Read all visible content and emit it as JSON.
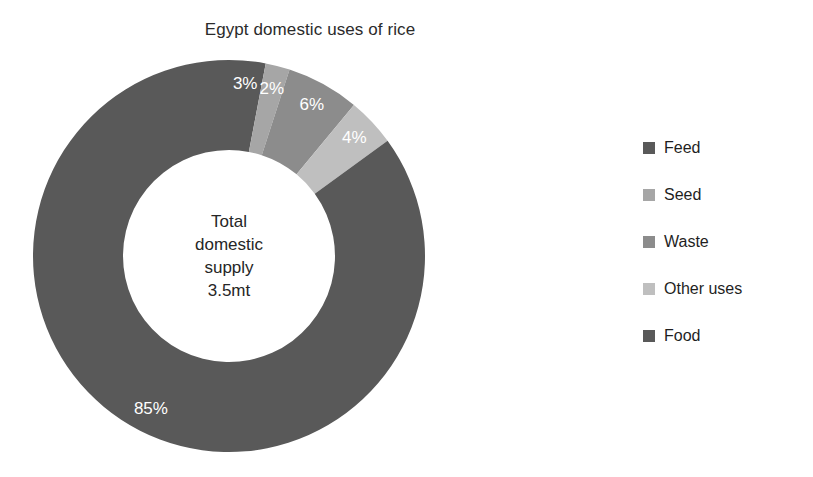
{
  "chart_data": {
    "type": "pie",
    "variant": "donut",
    "title": "Egypt domestic uses of rice",
    "categories": [
      "Feed",
      "Seed",
      "Waste",
      "Other uses",
      "Food"
    ],
    "values": [
      3,
      2,
      6,
      4,
      85
    ],
    "value_labels": [
      "3%",
      "2%",
      "6%",
      "4%",
      "85%"
    ],
    "unit": "%",
    "colors": [
      "#595959",
      "#a6a6a6",
      "#8c8c8c",
      "#bfbfbf",
      "#595959"
    ],
    "start_angle_deg": 0,
    "direction": "clockwise",
    "label_color": "#ffffff",
    "legend_position": "right",
    "grid": false,
    "center_label": {
      "lines": [
        "Total",
        "domestic",
        "supply",
        "3.5mt"
      ]
    },
    "geometry": {
      "center_x": 196,
      "center_y": 196,
      "outer_radius": 196,
      "inner_radius": 106,
      "label_radius": 172
    }
  },
  "legend": {
    "items": [
      {
        "label": "Feed",
        "color": "#595959"
      },
      {
        "label": "Seed",
        "color": "#a6a6a6"
      },
      {
        "label": "Waste",
        "color": "#8c8c8c"
      },
      {
        "label": "Other uses",
        "color": "#bfbfbf"
      },
      {
        "label": "Food",
        "color": "#595959"
      }
    ]
  }
}
